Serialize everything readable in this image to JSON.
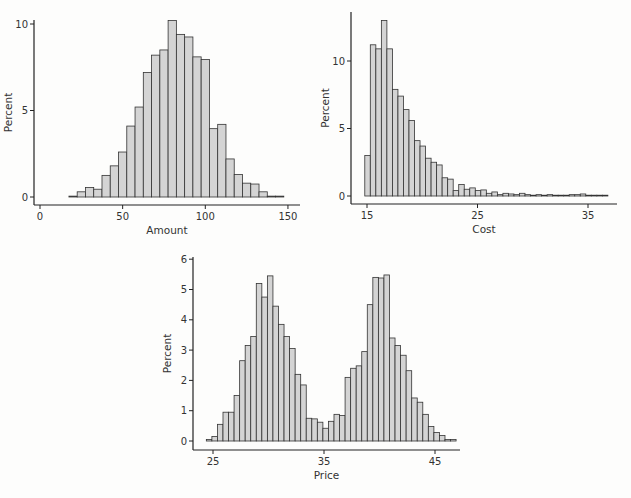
{
  "chart_data": [
    {
      "type": "bar",
      "subtype": "histogram",
      "title": "",
      "xlabel": "Amount",
      "ylabel": "Percent",
      "xlim": [
        -5,
        157
      ],
      "ylim": [
        0,
        10.5
      ],
      "xticks": [
        0,
        50,
        100,
        150
      ],
      "yticks": [
        0,
        5,
        10
      ],
      "grid": false,
      "bin_width": 5,
      "bin_start": 17.5,
      "values": [
        0.05,
        0.3,
        0.55,
        0.45,
        1.25,
        1.8,
        2.6,
        4.1,
        5.2,
        7.2,
        8.2,
        8.5,
        10.2,
        9.4,
        9.25,
        8.1,
        7.95,
        3.95,
        4.2,
        2.2,
        1.3,
        0.8,
        0.75,
        0.3,
        0.05,
        0.05
      ]
    },
    {
      "type": "bar",
      "subtype": "histogram",
      "title": "",
      "xlabel": "Cost",
      "ylabel": "Percent",
      "xlim": [
        14.5,
        37.8
      ],
      "ylim": [
        0,
        13.5
      ],
      "xticks": [
        15,
        25,
        35
      ],
      "yticks": [
        0,
        5,
        10
      ],
      "grid": false,
      "bin_width": 0.5,
      "bin_start": 14.8,
      "values": [
        3.0,
        11.2,
        10.9,
        13.0,
        10.9,
        7.9,
        7.4,
        6.4,
        5.6,
        4.1,
        3.7,
        2.8,
        2.5,
        2.3,
        1.35,
        1.25,
        0.4,
        0.85,
        0.5,
        0.6,
        0.4,
        0.45,
        0.2,
        0.3,
        0.1,
        0.2,
        0.15,
        0.1,
        0.2,
        0.1,
        0.05,
        0.1,
        0.05,
        0.1,
        0.05,
        0.05,
        0.05,
        0.1,
        0.1,
        0.15,
        0.05,
        0.02,
        0.02,
        0.02
      ]
    },
    {
      "type": "bar",
      "subtype": "histogram",
      "title": "",
      "xlabel": "Price",
      "ylabel": "Percent",
      "xlim": [
        23.2,
        47.8
      ],
      "ylim": [
        0,
        6
      ],
      "xticks": [
        25,
        35,
        45
      ],
      "yticks": [
        0,
        1,
        2,
        3,
        4,
        5,
        6
      ],
      "grid": false,
      "bin_width": 0.5,
      "bin_start": 24.4,
      "values": [
        0.05,
        0.15,
        0.55,
        0.95,
        0.95,
        1.5,
        2.65,
        3.15,
        3.45,
        5.2,
        4.75,
        5.45,
        4.45,
        3.85,
        3.45,
        3.05,
        2.2,
        1.85,
        0.75,
        0.73,
        0.62,
        0.42,
        0.65,
        0.88,
        0.84,
        2.1,
        2.4,
        2.48,
        2.95,
        4.5,
        5.4,
        5.38,
        5.48,
        3.4,
        3.15,
        2.83,
        2.32,
        1.42,
        1.28,
        0.88,
        0.48,
        0.28,
        0.18,
        0.05,
        0.05
      ]
    }
  ],
  "layout": [
    {
      "axis_x": 34,
      "axis_y_top": 20,
      "axis_bottom": 205,
      "axis_right": 300,
      "x0_px": 40,
      "px_per_x": 1.653,
      "y0_px": 197,
      "px_per_y": 17.3
    },
    {
      "axis_x": 351,
      "axis_y_top": 12,
      "axis_bottom": 204,
      "axis_right": 617,
      "x0_px": 367,
      "x0_val": 15,
      "px_per_x": 11.05,
      "y0_px": 196,
      "px_per_y": 13.5
    },
    {
      "axis_x": 193,
      "axis_y_top": 257,
      "axis_bottom": 450,
      "axis_right": 460,
      "x0_px": 213,
      "x0_val": 25,
      "px_per_x": 11.1,
      "y0_px": 441,
      "px_per_y": 30.3
    }
  ]
}
